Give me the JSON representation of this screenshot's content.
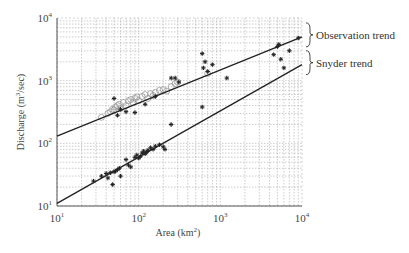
{
  "chart_data": {
    "type": "scatter",
    "title": "",
    "xlabel": "Area (km²)",
    "ylabel": "Discharge (m³/sec)",
    "xscale": "log",
    "yscale": "log",
    "xlim": [
      10,
      10000
    ],
    "ylim": [
      10,
      10000
    ],
    "grid": true,
    "x_ticks": [
      {
        "base": "10",
        "exp": "1",
        "value": 10
      },
      {
        "base": "10",
        "exp": "2",
        "value": 100
      },
      {
        "base": "10",
        "exp": "3",
        "value": 1000
      },
      {
        "base": "10",
        "exp": "4",
        "value": 10000
      }
    ],
    "y_ticks": [
      {
        "base": "10",
        "exp": "1",
        "value": 10
      },
      {
        "base": "10",
        "exp": "2",
        "value": 100
      },
      {
        "base": "10",
        "exp": "3",
        "value": 1000
      },
      {
        "base": "10",
        "exp": "4",
        "value": 10000
      }
    ],
    "annotations": [
      {
        "text": "Observation trend",
        "series": "Observation trend"
      },
      {
        "text": "Snyder trend",
        "series": "Snyder trend"
      }
    ],
    "series": [
      {
        "name": "Observation trend",
        "kind": "line",
        "x": [
          10,
          10000
        ],
        "y": [
          130,
          5000
        ]
      },
      {
        "name": "Snyder trend",
        "kind": "line",
        "x": [
          10,
          10000
        ],
        "y": [
          11,
          1800
        ]
      },
      {
        "name": "Observed peaks (circles)",
        "kind": "scatter",
        "marker": "open-circle",
        "x": [
          35,
          42,
          45,
          48,
          50,
          52,
          55,
          58,
          60,
          65,
          70,
          75,
          80,
          85,
          90,
          95,
          100,
          110,
          120,
          130,
          140,
          150,
          160,
          180,
          200,
          220,
          250,
          280,
          300,
          700
        ],
        "y": [
          260,
          300,
          320,
          350,
          340,
          380,
          400,
          420,
          360,
          450,
          400,
          480,
          500,
          450,
          520,
          550,
          480,
          560,
          600,
          520,
          620,
          580,
          650,
          700,
          720,
          680,
          800,
          900,
          950,
          1300
        ]
      },
      {
        "name": "Observed peaks (stars, upper)",
        "kind": "scatter",
        "marker": "star",
        "x": [
          50,
          55,
          60,
          70,
          90,
          120,
          160,
          250,
          280,
          310,
          600,
          620,
          650,
          700,
          800,
          1200,
          4500,
          5000,
          5200,
          5500,
          6000,
          7000,
          9000
        ],
        "y": [
          520,
          280,
          350,
          320,
          310,
          420,
          560,
          1100,
          1100,
          950,
          2700,
          1600,
          2000,
          1400,
          1800,
          1100,
          2600,
          3500,
          3800,
          2200,
          1600,
          3000,
          4800
        ]
      },
      {
        "name": "Snyder estimates (stars, lower)",
        "kind": "scatter",
        "marker": "star",
        "x": [
          28,
          35,
          40,
          42,
          45,
          48,
          50,
          52,
          55,
          58,
          60,
          70,
          75,
          80,
          90,
          95,
          100,
          105,
          110,
          115,
          120,
          125,
          130,
          140,
          150,
          160,
          180,
          200,
          210,
          250,
          600
        ],
        "y": [
          25,
          30,
          33,
          28,
          34,
          22,
          35,
          36,
          38,
          40,
          30,
          55,
          45,
          42,
          60,
          65,
          58,
          62,
          70,
          75,
          68,
          72,
          78,
          85,
          80,
          90,
          95,
          88,
          80,
          200,
          380
        ]
      }
    ]
  }
}
